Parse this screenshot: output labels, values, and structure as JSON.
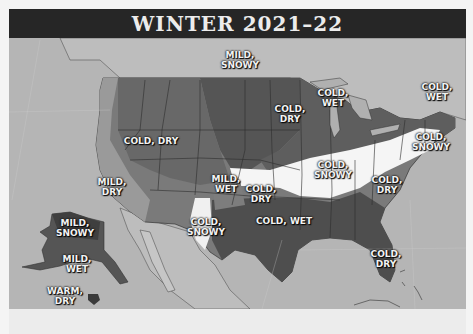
{
  "title": "WINTER 2021–22",
  "colors": {
    "ocean": "#b5b5b5",
    "canada_land": "#bdbdbd",
    "cold_dark": "#5a5a5a",
    "mild_mid": "#7a7a7a",
    "mild_light": "#9a9a9a",
    "snowy_white": "#f5f5f5",
    "title_bg": "#262626",
    "title_text": "#ececec",
    "label_text": "#f2f2f2"
  },
  "regions": [
    {
      "id": "northern-plains",
      "label": "MILD,\nSNOWY",
      "x": 240,
      "y": 60
    },
    {
      "id": "upper-midwest",
      "label": "COLD,\nDRY",
      "x": 290,
      "y": 114
    },
    {
      "id": "great-lakes",
      "label": "COLD,\nWET",
      "x": 333,
      "y": 98
    },
    {
      "id": "new-england",
      "label": "COLD,\nWET",
      "x": 437,
      "y": 92
    },
    {
      "id": "mountain-west",
      "label": "COLD, DRY",
      "x": 151,
      "y": 146
    },
    {
      "id": "mid-atlantic",
      "label": "COLD,\nSNOWY",
      "x": 431,
      "y": 142
    },
    {
      "id": "ohio-valley",
      "label": "COLD,\nSNOWY",
      "x": 333,
      "y": 170
    },
    {
      "id": "southeast-coast",
      "label": "COLD,\nDRY",
      "x": 387,
      "y": 185
    },
    {
      "id": "california",
      "label": "MILD,\nDRY",
      "x": 112,
      "y": 187
    },
    {
      "id": "central-rockies",
      "label": "MILD,\nWET",
      "x": 226,
      "y": 184
    },
    {
      "id": "southern-plains",
      "label": "COLD,\nDRY",
      "x": 261,
      "y": 194
    },
    {
      "id": "new-mexico-west-texas",
      "label": "COLD,\nSNOWY",
      "x": 206,
      "y": 227
    },
    {
      "id": "gulf-coast",
      "label": "COLD, WET",
      "x": 284,
      "y": 226
    },
    {
      "id": "florida",
      "label": "COLD,\nDRY",
      "x": 386,
      "y": 259
    },
    {
      "id": "alaska-north",
      "label": "MILD,\nSNOWY",
      "x": 75,
      "y": 228
    },
    {
      "id": "alaska-south",
      "label": "MILD,\nWET",
      "x": 77,
      "y": 264
    },
    {
      "id": "hawaii",
      "label": "WARM,\nDRY",
      "x": 65,
      "y": 296
    }
  ]
}
